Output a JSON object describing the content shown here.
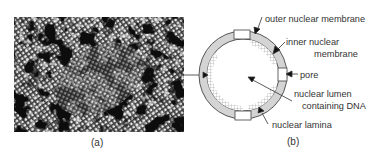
{
  "figure": {
    "panel_a": {
      "caption": "(a)",
      "description": "electron micrograph of nuclear lamina meshwork"
    },
    "panel_b": {
      "caption": "(b)",
      "labels": {
        "outer_membrane": "outer nuclear membrane",
        "inner_membrane_line1": "inner nuclear",
        "inner_membrane_line2": "membrane",
        "pore": "pore",
        "lumen_line1": "nuclear lumen",
        "lumen_line2": "containing DNA",
        "lamina": "nuclear lamina"
      }
    },
    "colors": {
      "ring_fill": "#d4d4d4",
      "ring_stroke": "#555555",
      "lamina_hatch": "#9a9a9a",
      "text": "#333333",
      "background": "#ffffff"
    }
  }
}
